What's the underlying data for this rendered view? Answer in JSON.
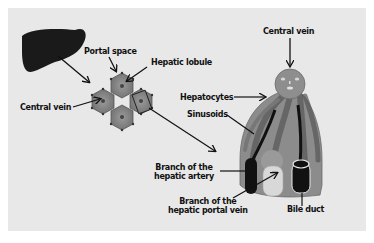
{
  "diagram": {
    "labels": {
      "portal_space": "Portal space",
      "hepatic_lobule": "Hepatic lobule",
      "central_vein_left": "Central vein",
      "central_vein_right": "Central vein",
      "hepatocytes": "Hepatocytes",
      "sinusoids": "Sinusoids",
      "hepatic_artery_line1": "Branch of the",
      "hepatic_artery_line2": "hepatic artery",
      "portal_vein_line1": "Branch of the",
      "portal_vein_line2": "hepatic portal vein",
      "bile_duct": "Bile duct"
    },
    "colors": {
      "background": "#e8e8e8",
      "liver": "#1a1a1a",
      "lobule": "#8a8a8a",
      "hepatocyte_plate": "#7d7d7d",
      "artery": "#111111",
      "portal_vein": "#d9d9d9",
      "bile_duct": "#111111"
    }
  }
}
